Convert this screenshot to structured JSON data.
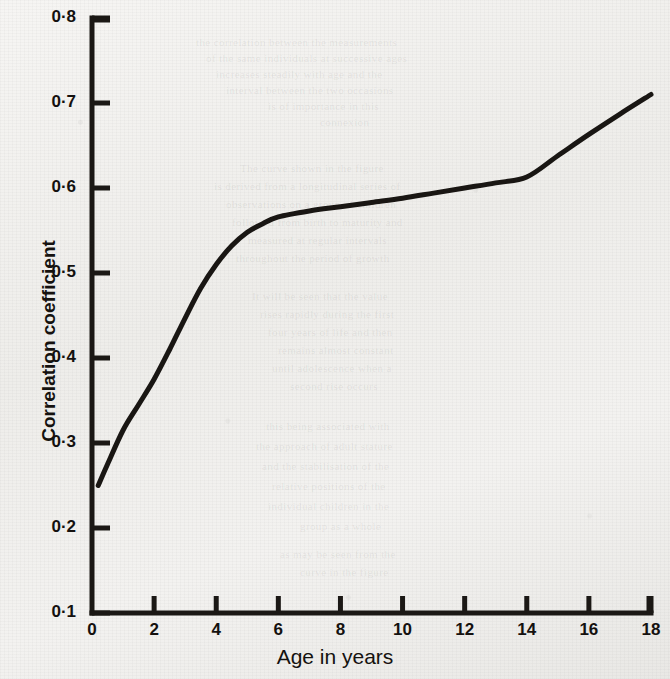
{
  "chart_data": {
    "type": "line",
    "title": "",
    "xlabel": "Age in years",
    "ylabel": "Correlation coefficient",
    "xlim": [
      0,
      18
    ],
    "ylim": [
      0.1,
      0.8
    ],
    "grid": false,
    "legend": "none",
    "x_tick_labels": [
      "0",
      "2",
      "4",
      "6",
      "8",
      "10",
      "12",
      "14",
      "16",
      "18"
    ],
    "x_tick_values": [
      0,
      2,
      4,
      6,
      8,
      10,
      12,
      14,
      16,
      18
    ],
    "y_tick_labels": [
      "0·1",
      "0·2",
      "0·3",
      "0·4",
      "0·5",
      "0·6",
      "0·7",
      "0·8"
    ],
    "y_tick_values": [
      0.1,
      0.2,
      0.3,
      0.4,
      0.5,
      0.6,
      0.7,
      0.8
    ],
    "series": [
      {
        "name": "Correlation coefficient",
        "color": "#191613",
        "line_width": 5,
        "x": [
          0.2,
          0.5,
          1.0,
          1.5,
          2.0,
          2.5,
          3.0,
          3.5,
          4.0,
          4.5,
          5.0,
          5.5,
          6.0,
          7.0,
          8.0,
          9.0,
          10.0,
          11.0,
          12.0,
          13.0,
          14.0,
          15.0,
          16.0,
          17.0,
          18.0
        ],
        "y": [
          0.25,
          0.275,
          0.315,
          0.345,
          0.375,
          0.41,
          0.447,
          0.482,
          0.51,
          0.532,
          0.548,
          0.558,
          0.566,
          0.573,
          0.578,
          0.583,
          0.588,
          0.594,
          0.6,
          0.606,
          0.613,
          0.638,
          0.663,
          0.687,
          0.71
        ]
      }
    ]
  },
  "background_ghost_lines": [
    {
      "text": "the correlation between the measurements",
      "x": 196,
      "y": 36
    },
    {
      "text": "of the same individuals at successive ages",
      "x": 206,
      "y": 52
    },
    {
      "text": "increases steadily with age and the",
      "x": 216,
      "y": 68
    },
    {
      "text": "interval between the two occasions",
      "x": 226,
      "y": 84
    },
    {
      "text": "is of importance in this",
      "x": 268,
      "y": 100
    },
    {
      "text": "connexion",
      "x": 320,
      "y": 116
    },
    {
      "text": "The curve shown in the figure",
      "x": 240,
      "y": 162
    },
    {
      "text": "is derived from a longitudinal series of",
      "x": 214,
      "y": 180
    },
    {
      "text": "observations on a group of children",
      "x": 226,
      "y": 198
    },
    {
      "text": "followed from birth to maturity and",
      "x": 232,
      "y": 216
    },
    {
      "text": "measured at regular intervals",
      "x": 248,
      "y": 234
    },
    {
      "text": "throughout the period of growth",
      "x": 236,
      "y": 252
    },
    {
      "text": "It will be seen that the value",
      "x": 252,
      "y": 290
    },
    {
      "text": "rises rapidly during the first",
      "x": 260,
      "y": 308
    },
    {
      "text": "four years of life and then",
      "x": 268,
      "y": 326
    },
    {
      "text": "remains almost constant",
      "x": 278,
      "y": 344
    },
    {
      "text": "until adolescence when a",
      "x": 272,
      "y": 362
    },
    {
      "text": "second rise occurs",
      "x": 290,
      "y": 380
    },
    {
      "text": "this being associated with",
      "x": 266,
      "y": 420
    },
    {
      "text": "the approach of adult stature",
      "x": 256,
      "y": 440
    },
    {
      "text": "and the stabilisation of the",
      "x": 262,
      "y": 460
    },
    {
      "text": "relative positions of the",
      "x": 272,
      "y": 480
    },
    {
      "text": "individual children in the",
      "x": 268,
      "y": 500
    },
    {
      "text": "group as a whole",
      "x": 300,
      "y": 520
    },
    {
      "text": "as may be seen from the",
      "x": 280,
      "y": 548
    },
    {
      "text": "curve in the figure",
      "x": 300,
      "y": 566
    }
  ]
}
